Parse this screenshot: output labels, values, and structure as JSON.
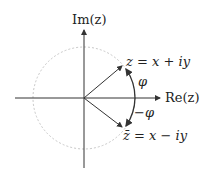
{
  "diagram": {
    "axes": {
      "imaginary_label": "Im(z)",
      "real_label": "Re(z)"
    },
    "points": {
      "z_label": "z = x + iy",
      "zbar_label": "z̄ = x − iy"
    },
    "angles": {
      "phi_label": "φ",
      "neg_phi_label": "−φ"
    },
    "colors": {
      "axis": "#333333",
      "vector": "#333333",
      "circle": "#bbbbbb",
      "text": "#222222"
    }
  }
}
